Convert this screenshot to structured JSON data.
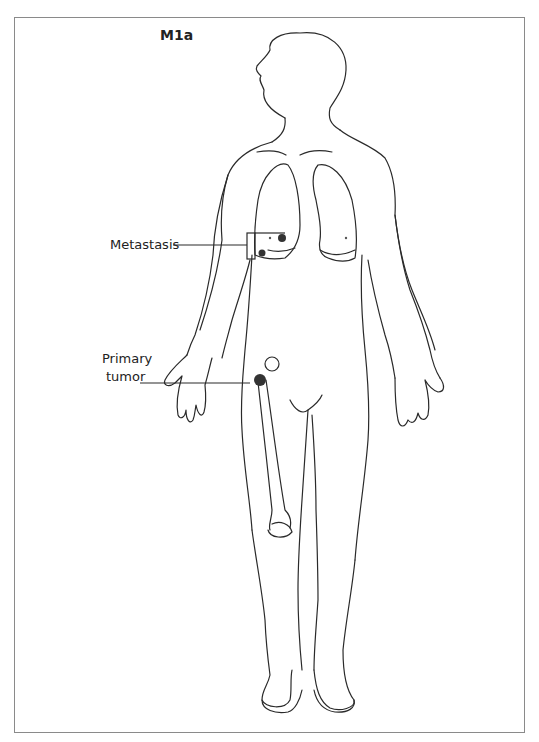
{
  "figure": {
    "title": "M1a",
    "labels": {
      "metastasis": "Metastasis",
      "primary_line1": "Primary",
      "primary_line2": "tumor"
    },
    "colors": {
      "line": "#2a2a2a",
      "frame": "#8a8a8a",
      "lesion": "#333333"
    }
  }
}
